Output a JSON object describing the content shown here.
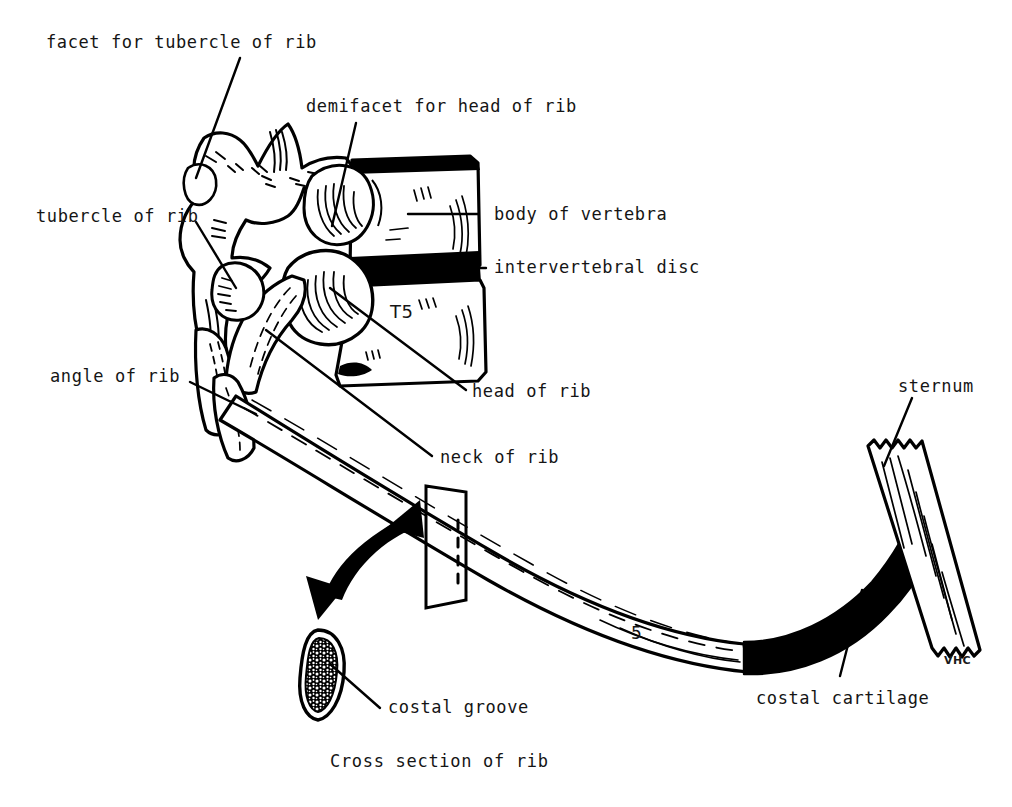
{
  "figure": {
    "caption": "Cross section of rib",
    "signature": "VHC",
    "vertebra_level": "T5",
    "rib_number": "5",
    "ink_color": "#000000",
    "background_color": "#ffffff"
  },
  "labels": {
    "facet_for_tubercle_of_rib": "facet for tubercle of rib",
    "demifacet_for_head_of_rib": "demifacet for head of rib",
    "tubercle_of_rib": "tubercle of rib",
    "body_of_vertebra": "body of vertebra",
    "intervertebral_disc": "intervertebral disc",
    "angle_of_rib": "angle of rib",
    "head_of_rib": "head of rib",
    "neck_of_rib": "neck of rib",
    "sternum": "sternum",
    "costal_cartilage": "costal cartilage",
    "costal_groove": "costal groove",
    "cross_section_of_rib": "Cross section of rib"
  },
  "structures": [
    {
      "name": "thoracic-vertebra",
      "description": "Thoracic vertebra T5 in lateral view with spinous and transverse processes"
    },
    {
      "name": "vertebral-body",
      "description": "Body of vertebra, rectangular block at right of vertebra"
    },
    {
      "name": "intervertebral-disc",
      "description": "Solid black wedge between vertebral bodies"
    },
    {
      "name": "rib-head",
      "description": "Rounded head of rib articulating with demifacet"
    },
    {
      "name": "rib-neck",
      "description": "Narrow neck between head and tubercle"
    },
    {
      "name": "rib-tubercle",
      "description": "Tubercle of rib articulating with transverse process facet"
    },
    {
      "name": "rib-angle",
      "description": "Angle of rib where shaft changes direction"
    },
    {
      "name": "rib-shaft",
      "description": "Long curving shaft of the fifth rib"
    },
    {
      "name": "costal-cartilage",
      "description": "Solid black cartilage segment joining rib to sternum"
    },
    {
      "name": "sternum",
      "description": "Sternum shown as a ragged-ended vertical strip at right"
    },
    {
      "name": "cutting-plane",
      "description": "Transparent parallelogram plane cutting across the rib shaft"
    },
    {
      "name": "curved-arrow",
      "description": "Thick curved arrow pointing from cutting plane to cross section"
    },
    {
      "name": "rib-cross-section",
      "description": "Teardrop-shaped cross section of rib showing trabecular bone"
    }
  ]
}
